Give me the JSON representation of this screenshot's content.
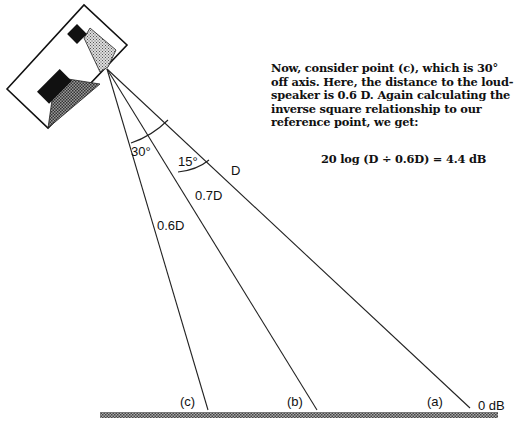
{
  "text": {
    "paragraph": "Now, consider point (c), which is 30° off axis. Here, the distance to the loud-speaker is 0.6 D.  Again calculating the inverse square relationship to our reference point, we get:",
    "formula": "20 log (D ÷ 0.6D) = 4.4 dB"
  },
  "labels": {
    "angle_30": "30°",
    "angle_15": "15°",
    "dist_a": "D",
    "dist_b": "0.7D",
    "dist_c": "0.6D",
    "point_a": "(a)",
    "point_b": "(b)",
    "point_c": "(c)",
    "ref_level": "0 dB"
  },
  "diagram": {
    "source": "loudspeaker",
    "rays": [
      {
        "point": "(a)",
        "angle_off_axis_deg": 0,
        "distance": "D"
      },
      {
        "point": "(b)",
        "angle_off_axis_deg": 15,
        "distance": "0.7D"
      },
      {
        "point": "(c)",
        "angle_off_axis_deg": 30,
        "distance": "0.6D"
      }
    ]
  }
}
